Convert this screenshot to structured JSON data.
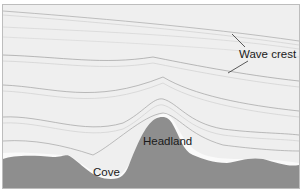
{
  "diagram": {
    "labels": {
      "wave_crest": "Wave crest",
      "headland": "Headland",
      "cove": "Cove"
    },
    "colors": {
      "water": "#efefef",
      "land": "#8e8e8e",
      "wave_line": "#9a9a9a",
      "foam": "#fafafa",
      "text": "#1a1a1a"
    }
  }
}
